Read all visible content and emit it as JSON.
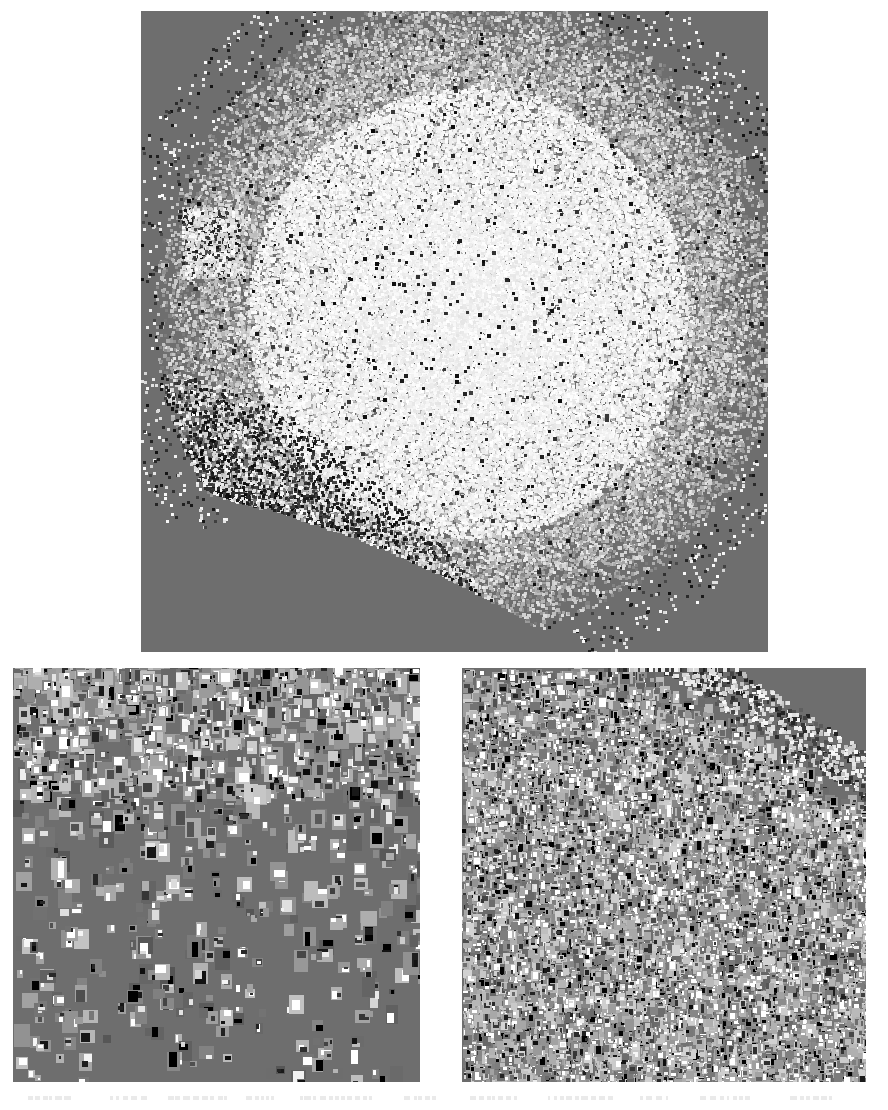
{
  "figure": {
    "title": "",
    "background_color": "#ffffff",
    "panel_background_color": "#6e6e6e",
    "width": 888,
    "height": 1110,
    "panel_count": 3,
    "panels": [
      {
        "id": "top",
        "name": "overview-embedding-panel",
        "label": "",
        "x": 141,
        "y": 11,
        "width": 627,
        "height": 641,
        "description": "Dome-shaped dense point cloud of image thumbnails, saturated white at center fading to gray at the boundary",
        "density": "very-high",
        "thumb_size_px": 3,
        "point_count": 52000,
        "shape": "dome",
        "bright_center": true
      },
      {
        "id": "bottom-left",
        "name": "sparse-detail-panel",
        "label": "",
        "x": 13,
        "y": 668,
        "width": 407,
        "height": 414,
        "description": "Sparse scatter of larger image thumbnails, dense along the top edge thinning toward the bottom",
        "density": "low",
        "thumb_size_px": 11,
        "point_count": 900,
        "shape": "top-weighted-gradient",
        "bright_center": false
      },
      {
        "id": "bottom-right",
        "name": "dense-detail-panel",
        "label": "",
        "x": 462,
        "y": 668,
        "width": 404,
        "height": 414,
        "description": "Tightly packed grid of small thumbnails filling the frame with a diagonal falloff at the upper-right corner",
        "density": "high",
        "thumb_size_px": 7,
        "point_count": 9500,
        "shape": "diagonal-corner-falloff",
        "bright_center": false
      }
    ]
  },
  "chart_data": {
    "type": "scatter",
    "title": "",
    "subtitle": "",
    "xlabel": "",
    "ylabel": "",
    "grid": false,
    "legend": null,
    "colormap": "grayscale",
    "background": "#6e6e6e",
    "series": [
      {
        "name": "overview-embedding",
        "panel": "top",
        "marker": "image-thumbnail",
        "marker_size_px": 3,
        "n_points": 52000,
        "xlim": [
          0,
          1
        ],
        "ylim": [
          0,
          1
        ],
        "density_profile": "radial-dome, peak brightness near center-right, sharp arc boundary at lower-left"
      },
      {
        "name": "sparse-detail",
        "panel": "bottom-left",
        "marker": "image-thumbnail",
        "marker_size_px": 11,
        "n_points": 900,
        "xlim": [
          0,
          1
        ],
        "ylim": [
          0,
          1
        ],
        "density_profile": "vertical gradient, dense at top, sparse at bottom"
      },
      {
        "name": "dense-detail",
        "panel": "bottom-right",
        "marker": "image-thumbnail",
        "marker_size_px": 7,
        "n_points": 9500,
        "xlim": [
          0,
          1
        ],
        "ylim": [
          0,
          1
        ],
        "density_profile": "near-uniform fill with diagonal cutoff in the upper-right corner"
      }
    ]
  },
  "caption": {
    "visible_text": "",
    "note": "only the clipped top edge of a caption line is visible at the bottom of the image"
  }
}
